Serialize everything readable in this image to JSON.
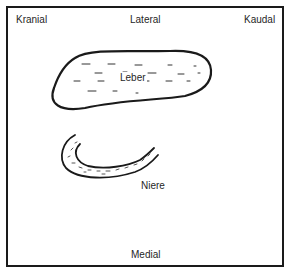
{
  "diagram": {
    "type": "anatomical-orientation-schematic",
    "orientation_labels": {
      "top_left": "Kranial",
      "top_center": "Lateral",
      "top_right": "Kaudal",
      "bottom_center": "Medial"
    },
    "organs": [
      {
        "id": "liver",
        "label": "Leber",
        "shape": "elongated-oval",
        "texture": "dashes"
      },
      {
        "id": "kidney",
        "label": "Niere",
        "shape": "crescent",
        "texture": "dotted-stipple"
      }
    ],
    "colors": {
      "line": "#1a1a1a",
      "background": "#ffffff"
    }
  }
}
